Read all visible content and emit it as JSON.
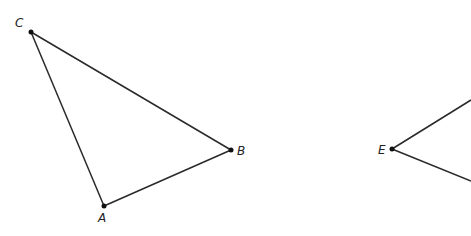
{
  "diagram": {
    "triangle_abc": {
      "points": {
        "A": {
          "label": "A",
          "x": 104,
          "y": 206
        },
        "B": {
          "label": "B",
          "x": 231,
          "y": 150
        },
        "C": {
          "label": "C",
          "x": 31,
          "y": 32
        }
      }
    },
    "figure_e": {
      "points": {
        "E": {
          "label": "E",
          "x": 392,
          "y": 149
        }
      },
      "rays_partial": [
        {
          "to_x": 471,
          "to_y": 100
        },
        {
          "to_x": 471,
          "to_y": 181
        }
      ]
    }
  }
}
